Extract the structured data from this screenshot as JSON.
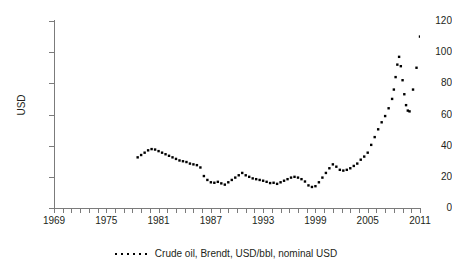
{
  "chart_data": {
    "type": "scatter",
    "title": "",
    "subtitle": "",
    "xlabel": "",
    "ylabel": "USD",
    "xlim": [
      1969,
      2011
    ],
    "ylim": [
      0,
      120
    ],
    "grid": false,
    "legend_position": "bottom-center",
    "marker": "dot",
    "marker_color": "#000000",
    "y_ticks": [
      0,
      20,
      40,
      60,
      80,
      100,
      120
    ],
    "y_tick_labels": [
      "0",
      "20",
      "40",
      "60",
      "80",
      "100",
      "120"
    ],
    "x_tick_labels": [
      "1969",
      "1975",
      "1981",
      "1987",
      "1993",
      "1999",
      "2005",
      "2011"
    ],
    "x_tick_values": [
      1969,
      1975,
      1981,
      1987,
      1993,
      1999,
      2005,
      2011
    ],
    "x_minor_tick_step": 1,
    "series": [
      {
        "name": "Crude oil, Brendt, USD/bbl, nominal USD",
        "x": [
          1978.6,
          1979.0,
          1979.4,
          1979.8,
          1980.2,
          1980.6,
          1981.0,
          1981.4,
          1981.8,
          1982.2,
          1982.6,
          1983.0,
          1983.4,
          1983.8,
          1984.2,
          1984.6,
          1985.0,
          1985.4,
          1985.8,
          1986.2,
          1986.6,
          1987.0,
          1987.4,
          1987.8,
          1988.2,
          1988.6,
          1989.0,
          1989.4,
          1989.8,
          1990.2,
          1990.6,
          1991.0,
          1991.4,
          1991.8,
          1992.2,
          1992.6,
          1993.0,
          1993.4,
          1993.8,
          1994.2,
          1994.6,
          1995.0,
          1995.4,
          1995.8,
          1996.2,
          1996.6,
          1997.0,
          1997.4,
          1997.8,
          1998.2,
          1998.6,
          1999.0,
          1999.4,
          1999.8,
          2000.2,
          2000.6,
          2001.0,
          2001.4,
          2001.8,
          2002.2,
          2002.6,
          2003.0,
          2003.4,
          2003.8,
          2004.2,
          2004.6,
          2005.0,
          2005.4,
          2005.8,
          2006.2,
          2006.6,
          2007.0,
          2007.4,
          2007.8,
          2008.0,
          2008.2,
          2008.4,
          2008.6,
          2008.8,
          2009.0,
          2009.2,
          2009.4,
          2009.6,
          2009.8,
          2010.2,
          2010.6,
          2011.0
        ],
        "y": [
          32.5,
          34.0,
          35.5,
          37.0,
          37.8,
          37.5,
          36.5,
          35.5,
          34.5,
          33.5,
          32.5,
          31.5,
          30.5,
          30.0,
          29.5,
          28.5,
          28.0,
          27.5,
          26.0,
          20.5,
          18.0,
          16.5,
          16.2,
          16.8,
          15.8,
          15.0,
          16.5,
          18.0,
          19.5,
          21.0,
          22.5,
          21.0,
          20.0,
          19.0,
          18.5,
          18.0,
          17.5,
          16.8,
          16.0,
          16.2,
          15.5,
          16.5,
          17.5,
          18.5,
          19.5,
          20.0,
          19.5,
          18.5,
          17.0,
          14.5,
          13.5,
          14.0,
          16.5,
          19.5,
          22.5,
          25.5,
          28.0,
          26.5,
          24.5,
          24.0,
          24.5,
          25.5,
          27.0,
          28.5,
          31.0,
          33.0,
          35.5,
          40.5,
          45.5,
          50.5,
          55.0,
          59.0,
          64.0,
          70.0,
          76.0,
          84.0,
          92.0,
          97.0,
          91.0,
          82.0,
          73.0,
          66.0,
          62.5,
          62.0,
          76.0,
          90.0,
          110.0
        ]
      }
    ]
  },
  "legend": {
    "entries": [
      {
        "label": "Crude oil, Brendt, USD/bbl, nominal USD",
        "marker": "dotted-line",
        "color": "#000000"
      }
    ]
  }
}
